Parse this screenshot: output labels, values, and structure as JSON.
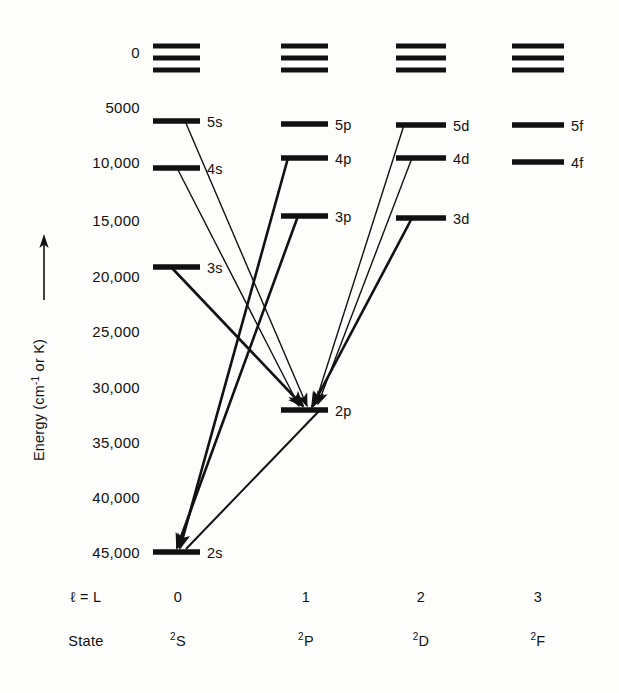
{
  "figure": {
    "kind": "grotrian-energy-level-diagram",
    "background_color": "#fdfdfb",
    "ink_color": "#111111",
    "y_axis": {
      "title": "Energy (cm",
      "title_superscript": "-1",
      "title_tail": " or K)",
      "full_title": "Energy (cm-1 or K)",
      "arrow_direction": "up",
      "tick_labels": [
        "0",
        "5000",
        "10,000",
        "15,000",
        "20,000",
        "25,000",
        "30,000",
        "35,000",
        "40,000",
        "45,000"
      ],
      "tick_values": [
        0,
        5000,
        10000,
        15000,
        20000,
        25000,
        30000,
        35000,
        40000,
        45000
      ],
      "tick_y_px": [
        52,
        107,
        162,
        220,
        276,
        331,
        387,
        442,
        497,
        552
      ]
    },
    "footer": {
      "row1_label": "ℓ = L",
      "row1_values": [
        "0",
        "1",
        "2",
        "3"
      ],
      "row2_label": "State",
      "row2_values": [
        {
          "sup": "2",
          "base": "S"
        },
        {
          "sup": "2",
          "base": "P"
        },
        {
          "sup": "2",
          "base": "D"
        },
        {
          "sup": "2",
          "base": "F"
        }
      ]
    },
    "columns": [
      {
        "id": "s",
        "l": 0,
        "term": "2S",
        "x_left": 153,
        "x_right": 200,
        "label_x": 207,
        "footer_x": 178
      },
      {
        "id": "p",
        "l": 1,
        "term": "2P",
        "x_left": 281,
        "x_right": 328,
        "label_x": 335,
        "footer_x": 306
      },
      {
        "id": "d",
        "l": 2,
        "term": "2D",
        "x_left": 396,
        "x_right": 446,
        "label_x": 453,
        "footer_x": 421
      },
      {
        "id": "f",
        "l": 3,
        "term": "2F",
        "x_left": 512,
        "x_right": 564,
        "label_x": 571,
        "footer_x": 538
      }
    ],
    "continuum": {
      "description": "three closely spaced bars at top of each column representing the continuum / series limit",
      "y_px": [
        46,
        58,
        70
      ],
      "count_per_column": 3,
      "stroke_width": 5
    },
    "levels": [
      {
        "label": "5s",
        "column": "s",
        "y_px": 121,
        "stroke_width": 5.5
      },
      {
        "label": "4s",
        "column": "s",
        "y_px": 168,
        "stroke_width": 5.5
      },
      {
        "label": "3s",
        "column": "s",
        "y_px": 267,
        "stroke_width": 5.5
      },
      {
        "label": "2s",
        "column": "s",
        "y_px": 552,
        "stroke_width": 5.5
      },
      {
        "label": "5p",
        "column": "p",
        "y_px": 124,
        "stroke_width": 5.5
      },
      {
        "label": "4p",
        "column": "p",
        "y_px": 158,
        "stroke_width": 5.5
      },
      {
        "label": "3p",
        "column": "p",
        "y_px": 216,
        "stroke_width": 5.5
      },
      {
        "label": "2p",
        "column": "p",
        "y_px": 410,
        "stroke_width": 5.5
      },
      {
        "label": "5d",
        "column": "d",
        "y_px": 125,
        "stroke_width": 5.5
      },
      {
        "label": "4d",
        "column": "d",
        "y_px": 158,
        "stroke_width": 5.5
      },
      {
        "label": "3d",
        "column": "d",
        "y_px": 218,
        "stroke_width": 5.5
      },
      {
        "label": "5f",
        "column": "f",
        "y_px": 125,
        "stroke_width": 5.5
      },
      {
        "label": "4f",
        "column": "f",
        "y_px": 162,
        "stroke_width": 5.5
      }
    ],
    "transitions": [
      {
        "id": "5s-2p",
        "from": "5s",
        "to": "2p",
        "x1": 185,
        "y1": 121,
        "x2": 307,
        "y2": 406,
        "stroke_width": 1.4,
        "weight": "thin"
      },
      {
        "id": "4s-2p",
        "from": "4s",
        "to": "2p",
        "x1": 177,
        "y1": 168,
        "x2": 299,
        "y2": 406,
        "stroke_width": 1.4,
        "weight": "thin"
      },
      {
        "id": "3s-2p",
        "from": "3s",
        "to": "2p",
        "x1": 171,
        "y1": 267,
        "x2": 303,
        "y2": 406,
        "stroke_width": 2.6,
        "weight": "thick"
      },
      {
        "id": "4p-2s",
        "from": "4p",
        "to": "2s",
        "x1": 288,
        "y1": 158,
        "x2": 180,
        "y2": 548,
        "stroke_width": 2.6,
        "weight": "thick"
      },
      {
        "id": "3p-2s",
        "from": "3p",
        "to": "2s",
        "x1": 298,
        "y1": 216,
        "x2": 177,
        "y2": 548,
        "stroke_width": 2.6,
        "weight": "thick"
      },
      {
        "id": "2p-2s",
        "from": "2p",
        "to": "2s",
        "x1": 320,
        "y1": 410,
        "x2": 186,
        "y2": 549,
        "stroke_width": 2.0,
        "weight": "medium",
        "arrow": false
      },
      {
        "id": "5d-2p",
        "from": "5d",
        "to": "2p",
        "x1": 404,
        "y1": 125,
        "x2": 315,
        "y2": 404,
        "stroke_width": 1.4,
        "weight": "thin"
      },
      {
        "id": "4d-2p",
        "from": "4d",
        "to": "2p",
        "x1": 412,
        "y1": 158,
        "x2": 318,
        "y2": 404,
        "stroke_width": 1.4,
        "weight": "thin"
      },
      {
        "id": "3d-2p",
        "from": "3d",
        "to": "2p",
        "x1": 412,
        "y1": 218,
        "x2": 312,
        "y2": 407,
        "stroke_width": 2.6,
        "weight": "thick"
      }
    ]
  }
}
